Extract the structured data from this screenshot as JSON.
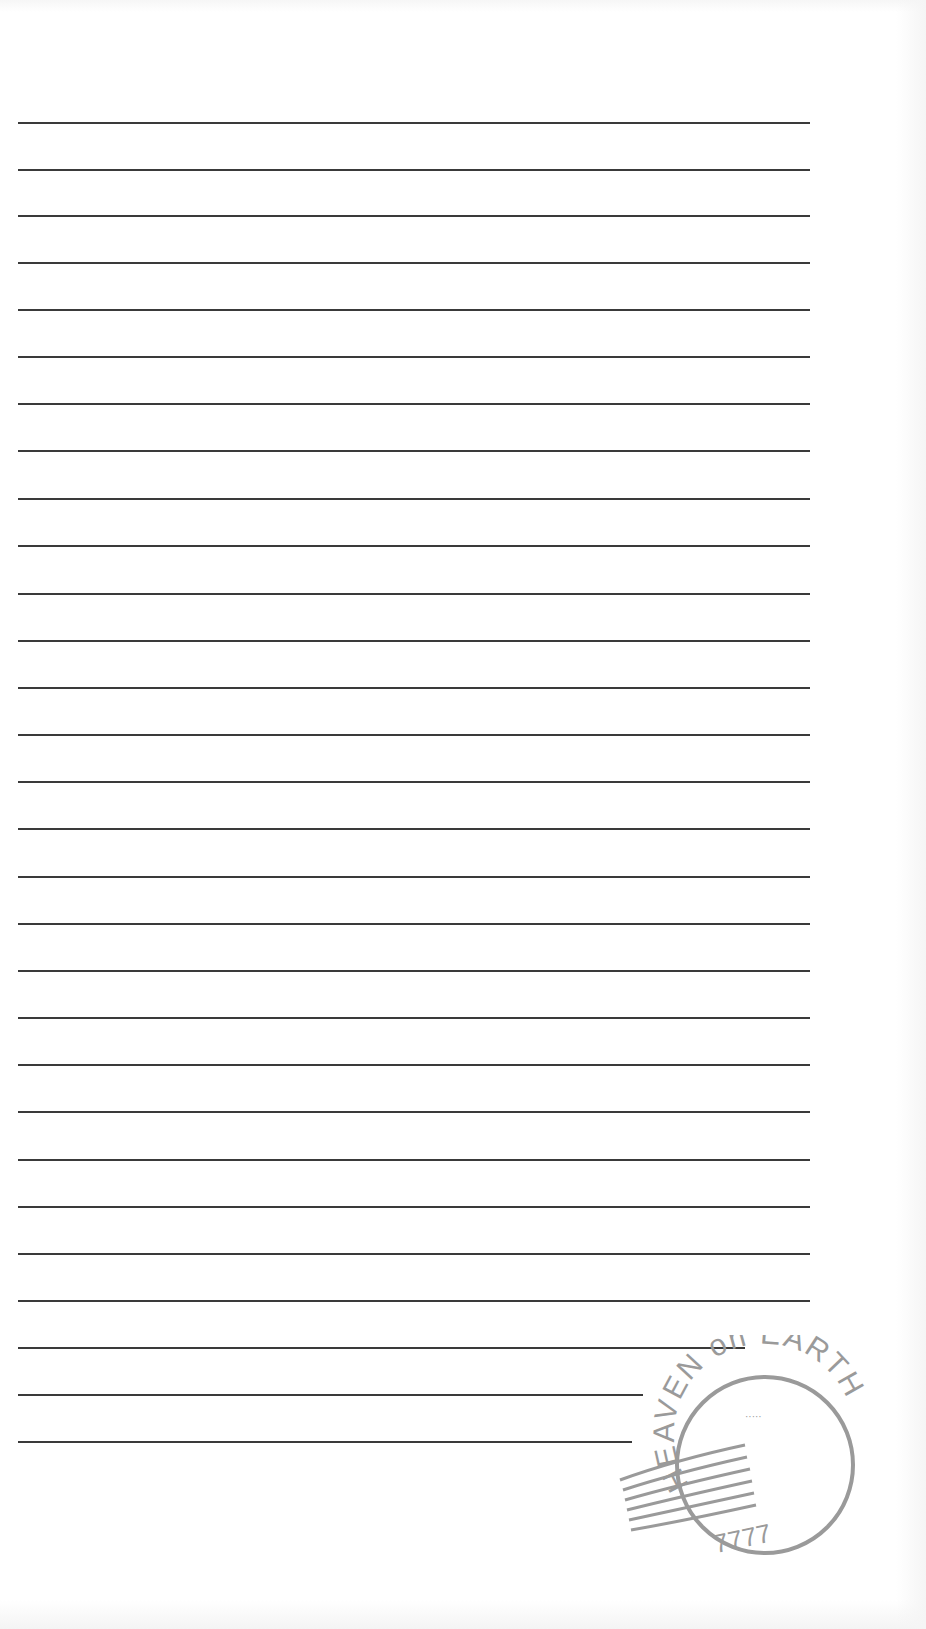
{
  "page": {
    "type": "lined stationery",
    "line_color": "#3a3a3a",
    "background": "#ffffff"
  },
  "lines": [
    {
      "y": 122,
      "x1": 18,
      "x2": 810
    },
    {
      "y": 169,
      "x1": 18,
      "x2": 810
    },
    {
      "y": 215,
      "x1": 18,
      "x2": 810
    },
    {
      "y": 262,
      "x1": 18,
      "x2": 810
    },
    {
      "y": 309,
      "x1": 18,
      "x2": 810
    },
    {
      "y": 356,
      "x1": 18,
      "x2": 810
    },
    {
      "y": 403,
      "x1": 18,
      "x2": 810
    },
    {
      "y": 450,
      "x1": 18,
      "x2": 810
    },
    {
      "y": 498,
      "x1": 18,
      "x2": 810
    },
    {
      "y": 545,
      "x1": 18,
      "x2": 810
    },
    {
      "y": 593,
      "x1": 18,
      "x2": 810
    },
    {
      "y": 640,
      "x1": 18,
      "x2": 810
    },
    {
      "y": 687,
      "x1": 18,
      "x2": 810
    },
    {
      "y": 734,
      "x1": 18,
      "x2": 810
    },
    {
      "y": 781,
      "x1": 18,
      "x2": 810
    },
    {
      "y": 828,
      "x1": 18,
      "x2": 810
    },
    {
      "y": 876,
      "x1": 18,
      "x2": 810
    },
    {
      "y": 923,
      "x1": 18,
      "x2": 810
    },
    {
      "y": 970,
      "x1": 18,
      "x2": 810
    },
    {
      "y": 1017,
      "x1": 18,
      "x2": 810
    },
    {
      "y": 1064,
      "x1": 18,
      "x2": 810
    },
    {
      "y": 1111,
      "x1": 18,
      "x2": 810
    },
    {
      "y": 1159,
      "x1": 18,
      "x2": 810
    },
    {
      "y": 1206,
      "x1": 18,
      "x2": 810
    },
    {
      "y": 1253,
      "x1": 18,
      "x2": 810
    },
    {
      "y": 1300,
      "x1": 18,
      "x2": 810
    },
    {
      "y": 1347,
      "x1": 18,
      "x2": 745
    },
    {
      "y": 1394,
      "x1": 18,
      "x2": 643
    },
    {
      "y": 1441,
      "x1": 18,
      "x2": 632
    }
  ],
  "stamp": {
    "top_text": "HEAVEN on EARTH",
    "bottom_text": "7777",
    "center_text": "·····",
    "color": "#9a9a9a"
  }
}
